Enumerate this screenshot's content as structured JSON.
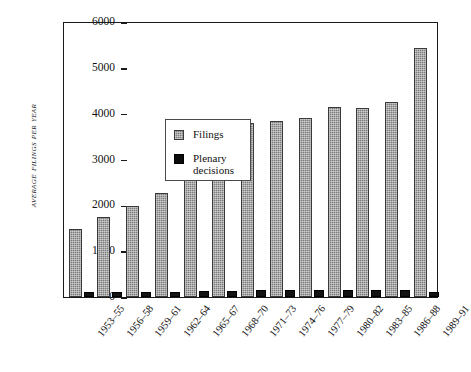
{
  "chart_data": {
    "type": "bar",
    "title": "",
    "xlabel": "",
    "ylabel": "Average Filings per Year",
    "ylim": [
      0,
      6000
    ],
    "yticks": [
      0,
      1000,
      2000,
      3000,
      4000,
      5000,
      6000
    ],
    "ytick_labels": [
      "0",
      "1000",
      "2000",
      "3000",
      "4000",
      "5000",
      "6000"
    ],
    "grid": false,
    "legend_position": "upper left inside",
    "categories": [
      "1953–55",
      "1956–58",
      "1959–61",
      "1962–64",
      "1965–67",
      "1968–70",
      "1971–73",
      "1974–76",
      "1977–79",
      "1980–82",
      "1983–85",
      "1986–88",
      "1989–91"
    ],
    "series": [
      {
        "name": "Filings",
        "color": "#7c7c7c",
        "values": [
          1480,
          1750,
          1980,
          2280,
          2810,
          3250,
          3800,
          3830,
          3900,
          4150,
          4130,
          4250,
          5440
        ]
      },
      {
        "name": "Plenary decisions",
        "color": "#131313",
        "values": [
          110,
          120,
          120,
          120,
          130,
          140,
          150,
          150,
          145,
          150,
          150,
          150,
          120
        ]
      }
    ]
  },
  "legend": {
    "items": [
      {
        "label": "Filings",
        "swatch": "filings-swatch"
      },
      {
        "label": "Plenary\ndecisions",
        "label_line1": "Plenary",
        "label_line2": "decisions",
        "swatch": "plenary-swatch"
      }
    ]
  },
  "axes": {
    "y_title_lead": "A",
    "y_title_rest": "VERAGE ",
    "y_title_full": "Average Filings per Year"
  }
}
